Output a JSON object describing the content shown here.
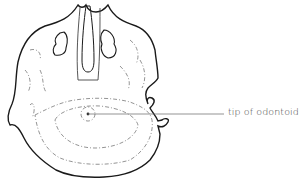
{
  "diagram": {
    "labels": [
      {
        "text": "tip of odontoid",
        "target": "odontoid-tip",
        "pointer_x": 88,
        "pointer_y": 114
      }
    ]
  },
  "colors": {
    "background": "#ffffff",
    "outline": "#1a1a1a",
    "detail": "#555555",
    "leader": "#666666",
    "label_text": "#3a3a3a"
  }
}
